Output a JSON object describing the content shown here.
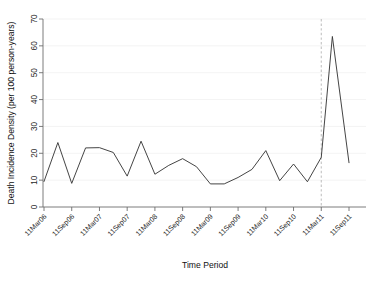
{
  "chart_data": {
    "type": "line",
    "title": "",
    "xlabel": "Time Period",
    "ylabel": "Death Incidence Density (per 100 person-years)",
    "ylim": [
      0,
      70
    ],
    "yticks": [
      0,
      10,
      20,
      30,
      40,
      50,
      60,
      70
    ],
    "ytick_labels": [
      "0",
      "10",
      "20",
      "30",
      "40",
      "50",
      "60",
      "70"
    ],
    "grid": true,
    "legend": "none",
    "xtick_labels": [
      "11Mar06",
      "11Sep06",
      "11Mar07",
      "11Sep07",
      "11Mar08",
      "11Sep08",
      "11Mar09",
      "11Sep09",
      "11Mar10",
      "11Sep10",
      "11Mar11",
      "11Sep11"
    ],
    "x": [
      0.0,
      0.25,
      0.5,
      0.75,
      1.0,
      1.25,
      1.5,
      1.75,
      2.0,
      2.25,
      2.5,
      2.75,
      3.0,
      3.25,
      3.5,
      3.75,
      4.0,
      4.25,
      4.5,
      4.75,
      5.0,
      5.2,
      5.5
    ],
    "values": [
      9.5,
      24.0,
      8.8,
      22.0,
      22.1,
      20.3,
      11.5,
      24.5,
      12.2,
      15.5,
      18.0,
      15.0,
      8.6,
      8.6,
      11.0,
      14.0,
      21.0,
      9.8,
      16.0,
      9.4,
      18.5,
      63.5,
      16.5
    ],
    "annotations": [
      {
        "name": "reference-line",
        "type": "vertical-dashed-line",
        "x_label": "11Mar11",
        "color": "#c2c2c2"
      }
    ],
    "series_color": "#3a3a3a",
    "peak_value": 63.5,
    "peak_label": "11Mar11"
  }
}
